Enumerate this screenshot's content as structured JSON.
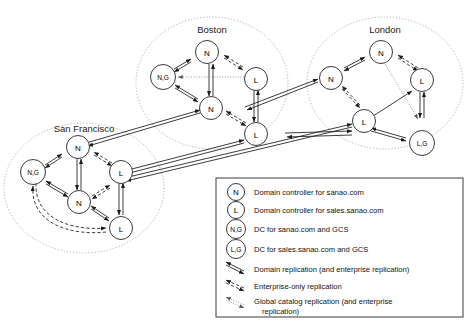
{
  "diagram": {
    "sites": [
      {
        "id": "boston",
        "label": "Boston"
      },
      {
        "id": "london",
        "label": "London"
      },
      {
        "id": "sanfrancisco",
        "label": "San Francisco"
      }
    ],
    "node_types": {
      "N": "N",
      "L": "L",
      "NG": "N,G",
      "LG": "L,G"
    },
    "nodes": [
      {
        "site": "boston",
        "id": "bos-n-top",
        "type": "N",
        "label": "N"
      },
      {
        "site": "boston",
        "id": "bos-ng",
        "type": "NG",
        "label": "N,G"
      },
      {
        "site": "boston",
        "id": "bos-l-right",
        "type": "L",
        "label": "L"
      },
      {
        "site": "boston",
        "id": "bos-n-mid",
        "type": "N",
        "label": "N"
      },
      {
        "site": "boston",
        "id": "bos-l-bottom",
        "type": "L",
        "label": "L"
      },
      {
        "site": "london",
        "id": "lon-n-top",
        "type": "N",
        "label": "N"
      },
      {
        "site": "london",
        "id": "lon-n-left",
        "type": "N",
        "label": "N"
      },
      {
        "site": "london",
        "id": "lon-l-right",
        "type": "L",
        "label": "L"
      },
      {
        "site": "london",
        "id": "lon-l-mid",
        "type": "L",
        "label": "L"
      },
      {
        "site": "london",
        "id": "lon-lg",
        "type": "LG",
        "label": "L,G"
      },
      {
        "site": "sanfrancisco",
        "id": "sf-n-top",
        "type": "N",
        "label": "N"
      },
      {
        "site": "sanfrancisco",
        "id": "sf-ng",
        "type": "NG",
        "label": "N,G"
      },
      {
        "site": "sanfrancisco",
        "id": "sf-l-right",
        "type": "L",
        "label": "L"
      },
      {
        "site": "sanfrancisco",
        "id": "sf-n-mid",
        "type": "N",
        "label": "N"
      },
      {
        "site": "sanfrancisco",
        "id": "sf-l-bottom",
        "type": "L",
        "label": "L"
      }
    ],
    "link_styles": {
      "domain": "solid",
      "enterprise": "dashed",
      "global_catalog": "dotted"
    }
  },
  "legend": {
    "entries": [
      {
        "symbol": "N",
        "kind": "node",
        "text": "Domain controller for sanao.com"
      },
      {
        "symbol": "L",
        "kind": "node",
        "text": "Domain controller for sales.sanao.com"
      },
      {
        "symbol": "N,G",
        "kind": "node",
        "text": "DC for sanao.com and GCS"
      },
      {
        "symbol": "L,G",
        "kind": "node",
        "text": "DC for sales.sanao.com and GCS"
      },
      {
        "symbol": "arrow-solid",
        "kind": "line",
        "text": "Domain replication (and enterprise replication)"
      },
      {
        "symbol": "arrow-dashed",
        "kind": "line",
        "text": "Enterprise-only replication"
      },
      {
        "symbol": "arrow-dotted",
        "kind": "line",
        "text": "Global catalog replication (and enterprise"
      },
      {
        "symbol": "arrow-dotted-cont",
        "kind": "continuation",
        "text": "replication)"
      }
    ]
  },
  "colors": {
    "stroke": "#1a1a1a",
    "ring": "#9a9a9a",
    "dotted": "#7d7d7d",
    "legend_border": "#3b3b3b",
    "background": "#ffffff"
  }
}
